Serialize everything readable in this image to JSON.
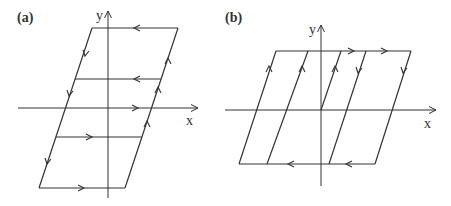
{
  "figure": {
    "panels": [
      {
        "id": "a",
        "label": "(a)",
        "x_axis_label": "x",
        "y_axis_label": "y",
        "description": "Parallelogram hysteresis loop with horizontal traversals; top/middle-upper lines leftward, lower lines rightward, left edge downward, right edge upward"
      },
      {
        "id": "b",
        "label": "(b)",
        "x_axis_label": "x",
        "y_axis_label": "y",
        "description": "Parallelogram loop with slanted traversals; left slanted lines upward, right slanted lines downward, top edge rightward, bottom edge leftward"
      }
    ],
    "colors": {
      "stroke": "#333333",
      "background": "#ffffff"
    }
  }
}
